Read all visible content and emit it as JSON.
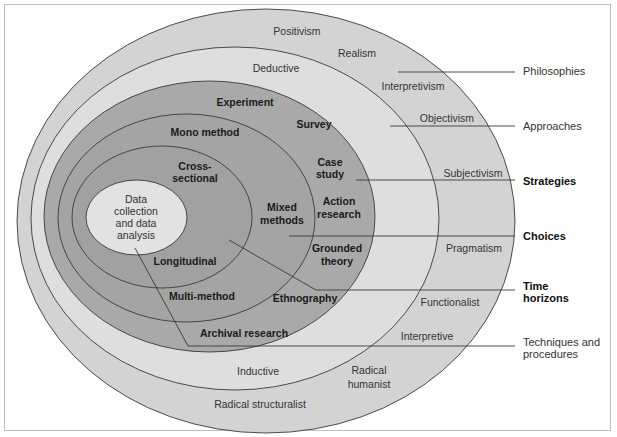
{
  "diagram": {
    "colors": {
      "philosophies_ring": "#d3d3d3",
      "approaches_ring": "#dedede",
      "strategies_ring": "#a9a9a9",
      "choices_ring": "#a4a4a4",
      "time_horizons_ring": "#a0a0a0",
      "core": "#e2e2e2",
      "outline": "#3a3a3a"
    },
    "layers": {
      "philosophies": {
        "label": "Philosophies",
        "items": [
          "Positivism",
          "Realism",
          "Interpretivism",
          "Objectivism",
          "Subjectivism",
          "Pragmatism",
          "Functionalist",
          "Interpretive",
          "Radical humanist",
          "Radical structuralist"
        ]
      },
      "approaches": {
        "label": "Approaches",
        "items": [
          "Deductive",
          "Inductive"
        ]
      },
      "strategies": {
        "label": "Strategies",
        "items": [
          "Experiment",
          "Survey",
          "Case study",
          "Action research",
          "Grounded theory",
          "Ethnography",
          "Archival research"
        ]
      },
      "choices": {
        "label": "Choices",
        "items": [
          "Mono method",
          "Mixed methods",
          "Multi-method"
        ]
      },
      "time_horizons": {
        "label_line1": "Time",
        "label_line2": "horizons",
        "items": [
          "Cross-sectional",
          "Longitudinal"
        ]
      },
      "techniques": {
        "label_line1": "Techniques and",
        "label_line2": "procedures",
        "core_line1": "Data",
        "core_line2": "collection",
        "core_line3": "and data",
        "core_line4": "analysis"
      }
    },
    "ring_text": {
      "positivism": "Positivism",
      "realism": "Realism",
      "interpretivism": "Interpretivism",
      "objectivism": "Objectivism",
      "subjectivism": "Subjectivism",
      "pragmatism": "Pragmatism",
      "functionalist": "Functionalist",
      "interpretive": "Interpretive",
      "radical_humanist_1": "Radical",
      "radical_humanist_2": "humanist",
      "radical_structuralist": "Radical structuralist",
      "deductive": "Deductive",
      "inductive": "Inductive",
      "experiment": "Experiment",
      "survey": "Survey",
      "case_study_1": "Case",
      "case_study_2": "study",
      "action_research_1": "Action",
      "action_research_2": "research",
      "grounded_theory_1": "Grounded",
      "grounded_theory_2": "theory",
      "ethnography": "Ethnography",
      "archival_research": "Archival research",
      "mono_method": "Mono method",
      "mixed_methods_1": "Mixed",
      "mixed_methods_2": "methods",
      "multi_method": "Multi-method",
      "cross_sectional_1": "Cross-",
      "cross_sectional_2": "sectional",
      "longitudinal": "Longitudinal"
    }
  }
}
